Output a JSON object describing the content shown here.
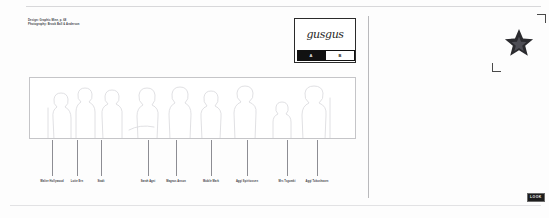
{
  "document": {
    "background_color": "#fdfdfd",
    "rule_color": "#d8d8da",
    "divider_color": "#b9b9bc"
  },
  "credits": {
    "lines": [
      "Design: Graphic Mine, p. 68",
      "Photography: Brook Ball & Anderson"
    ]
  },
  "logo": {
    "wordmark": "gusgus",
    "cells": [
      {
        "label": "A",
        "style": "dark"
      },
      {
        "label": "B",
        "style": "light"
      }
    ],
    "border_color": "#2a2a2a"
  },
  "panel": {
    "label": "group-silhouette-lineup",
    "outline_color": "#c5c5c8",
    "figure_count": 9
  },
  "captions": [
    {
      "label": "Walter Hollywood",
      "x": 52
    },
    {
      "label": "Lotte Ern",
      "x": 77
    },
    {
      "label": "Stadt",
      "x": 101
    },
    {
      "label": "Sarah Agni",
      "x": 148
    },
    {
      "label": "Magnus Anson",
      "x": 176
    },
    {
      "label": "Mobile Mark",
      "x": 211
    },
    {
      "label": "Aggi Spiritussen",
      "x": 247
    },
    {
      "label": "Mrs Tsgomki",
      "x": 287
    },
    {
      "label": "Aggi Tokoshasen",
      "x": 317
    }
  ],
  "star_plate": {
    "name": "star-graphic",
    "fill_color": "#2b2b2f",
    "crop_mark_color": "#4a4a4a"
  },
  "badge": {
    "label": "LOOK",
    "background_color": "#1d1d1d",
    "text_color": "#f5f5f5"
  }
}
